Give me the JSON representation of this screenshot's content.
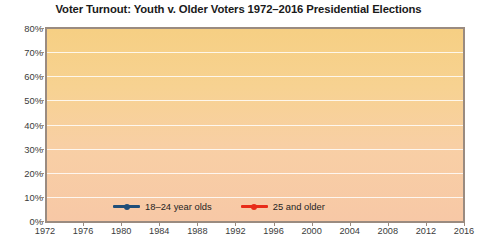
{
  "chart_data": {
    "type": "line",
    "title": "Voter Turnout: Youth v. Older Voters 1972–2016 Presidential Elections",
    "xlabel": "",
    "ylabel": "",
    "categories": [
      "1972",
      "1976",
      "1980",
      "1984",
      "1988",
      "1992",
      "1996",
      "2000",
      "2004",
      "2008",
      "2012",
      "2016"
    ],
    "x": [
      1972,
      1976,
      1980,
      1984,
      1988,
      1992,
      1996,
      2000,
      2004,
      2008,
      2012,
      2016
    ],
    "ylim": [
      0,
      80
    ],
    "ytick_labels": [
      "0%",
      "10%",
      "20%",
      "30%",
      "40%",
      "50%",
      "60%",
      "70%",
      "80%"
    ],
    "ytick_values": [
      0,
      10,
      20,
      30,
      40,
      50,
      60,
      70,
      80
    ],
    "grid": true,
    "legend_position": "bottom-center",
    "series": [
      {
        "name": "18–24 year olds",
        "color": "#1f4e79",
        "values": [
          52.1,
          44.6,
          43.4,
          44.5,
          40.3,
          48.6,
          36.1,
          36.5,
          46.7,
          48.9,
          42.0,
          43.8
        ]
      },
      {
        "name": "25 and older",
        "color": "#e82c19",
        "values": [
          68.8,
          65.7,
          68.5,
          69.1,
          66.3,
          71.3,
          62.6,
          63.6,
          66.9,
          66.6,
          65.3,
          62.6
        ]
      }
    ]
  },
  "legend": {
    "items": [
      {
        "label": "18–24 year olds",
        "color": "#1f4e79"
      },
      {
        "label": "25 and older",
        "color": "#e82c19"
      }
    ]
  },
  "colors": {
    "youth_line": "#1f4e79",
    "older_line": "#e82c19",
    "plot_top": "#f6cf83",
    "plot_bottom": "#f7c8a6",
    "axis": "#9a8b80",
    "gridline": "#ffffff",
    "text": "#1a1a1a"
  }
}
